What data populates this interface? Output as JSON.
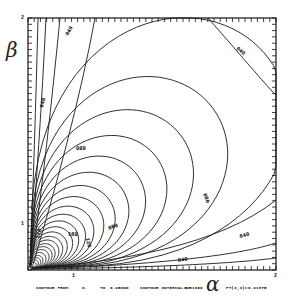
{
  "chart_data": {
    "type": "contour",
    "title": "",
    "xlabel": "α",
    "ylabel": "β",
    "xlim": [
      0,
      2
    ],
    "ylim": [
      0,
      2
    ],
    "x_ticks_labeled": [
      "1",
      "2"
    ],
    "y_ticks_labeled": [
      "1",
      "2"
    ],
    "contour_from": "0.",
    "contour_to": "0.25000",
    "contour_interval": "0.01000",
    "point_value_label": "PT(3,3)=",
    "point_value": "0.21875",
    "contour_labels": [
      "040",
      "080",
      "120",
      "160",
      "200"
    ],
    "level_values": [
      0.04,
      0.08,
      0.12,
      0.16,
      0.2
    ],
    "grid": false,
    "legend": "none"
  },
  "labels": {
    "alpha": "α",
    "beta": "β",
    "x_tick_1": "1",
    "x_tick_2": "2",
    "y_tick_1": "1",
    "y_tick_2": "2"
  },
  "footer": {
    "from_label": "CONTOUR FROM",
    "from_value": "0.",
    "to_label": "TO",
    "to_value": "0.25000",
    "interval_label": "CONTOUR INTERVAL OF",
    "interval_value": "0.01000",
    "pt_label": "PT(3,3)=",
    "pt_value": "0.21875"
  }
}
